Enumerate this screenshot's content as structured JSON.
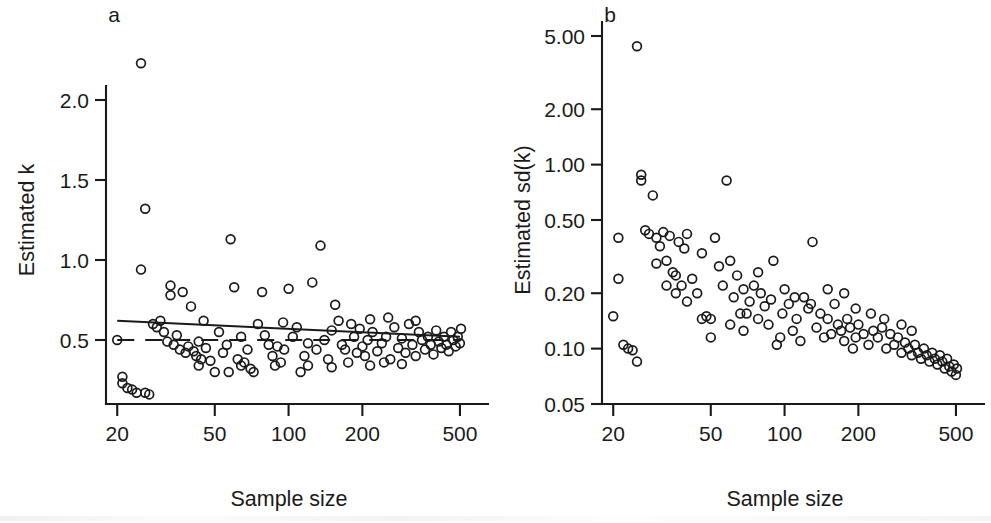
{
  "figure": {
    "background": "#ffffff",
    "ink_color": "#1a1a1a",
    "panel_labels": {
      "a": "a",
      "b": "b"
    }
  },
  "chart_data": [
    {
      "type": "scatter",
      "panel": "a",
      "title": "",
      "xlabel": "Sample size",
      "ylabel": "Estimated k",
      "xscale": "log",
      "yscale": "linear",
      "xlim": [
        18,
        560
      ],
      "ylim": [
        0.1,
        2.4
      ],
      "xticks": [
        20,
        50,
        100,
        200,
        500
      ],
      "xticklabels": [
        "20",
        "50",
        "100",
        "200",
        "500"
      ],
      "yticks": [
        0.5,
        1.0,
        1.5,
        2.0
      ],
      "yticklabels": [
        "0.5",
        "1.0",
        "1.5",
        "2.0"
      ],
      "grid": false,
      "legend": "none",
      "marker": "open-circle",
      "annotations": [
        {
          "kind": "fit-line",
          "style": "solid",
          "label": "regression of estimated k on log sample size",
          "x": [
            20,
            500
          ],
          "y": [
            0.62,
            0.52
          ]
        },
        {
          "kind": "reference-line",
          "style": "dashed",
          "label": "true k = 0.5",
          "x": [
            20,
            500
          ],
          "y": [
            0.5,
            0.5
          ]
        }
      ],
      "points": [
        [
          20,
          0.5
        ],
        [
          21,
          0.27
        ],
        [
          21,
          0.23
        ],
        [
          22,
          0.2
        ],
        [
          23,
          0.19
        ],
        [
          24,
          0.17
        ],
        [
          25,
          2.23
        ],
        [
          25,
          0.94
        ],
        [
          26,
          1.32
        ],
        [
          26,
          0.17
        ],
        [
          27,
          0.16
        ],
        [
          28,
          0.6
        ],
        [
          29,
          0.58
        ],
        [
          30,
          0.62
        ],
        [
          31,
          0.55
        ],
        [
          32,
          0.49
        ],
        [
          33,
          0.84
        ],
        [
          33,
          0.78
        ],
        [
          34,
          0.47
        ],
        [
          35,
          0.53
        ],
        [
          36,
          0.44
        ],
        [
          37,
          0.8
        ],
        [
          38,
          0.42
        ],
        [
          39,
          0.46
        ],
        [
          40,
          0.71
        ],
        [
          41,
          0.43
        ],
        [
          42,
          0.4
        ],
        [
          43,
          0.49
        ],
        [
          44,
          0.38
        ],
        [
          46,
          0.45
        ],
        [
          48,
          0.37
        ],
        [
          50,
          0.3
        ],
        [
          52,
          0.55
        ],
        [
          54,
          0.42
        ],
        [
          56,
          0.47
        ],
        [
          58,
          1.13
        ],
        [
          60,
          0.83
        ],
        [
          62,
          0.38
        ],
        [
          64,
          0.52
        ],
        [
          66,
          0.36
        ],
        [
          68,
          0.44
        ],
        [
          70,
          0.32
        ],
        [
          72,
          0.3
        ],
        [
          75,
          0.6
        ],
        [
          78,
          0.8
        ],
        [
          80,
          0.53
        ],
        [
          83,
          0.47
        ],
        [
          86,
          0.4
        ],
        [
          90,
          0.46
        ],
        [
          93,
          0.36
        ],
        [
          96,
          0.44
        ],
        [
          100,
          0.82
        ],
        [
          104,
          0.52
        ],
        [
          108,
          0.58
        ],
        [
          112,
          0.3
        ],
        [
          116,
          0.4
        ],
        [
          120,
          0.48
        ],
        [
          125,
          0.86
        ],
        [
          130,
          0.44
        ],
        [
          135,
          1.09
        ],
        [
          140,
          0.5
        ],
        [
          145,
          0.38
        ],
        [
          150,
          0.56
        ],
        [
          155,
          0.72
        ],
        [
          160,
          0.62
        ],
        [
          165,
          0.47
        ],
        [
          170,
          0.44
        ],
        [
          175,
          0.36
        ],
        [
          180,
          0.6
        ],
        [
          185,
          0.52
        ],
        [
          190,
          0.42
        ],
        [
          195,
          0.57
        ],
        [
          200,
          0.46
        ],
        [
          205,
          0.4
        ],
        [
          210,
          0.5
        ],
        [
          215,
          0.34
        ],
        [
          220,
          0.55
        ],
        [
          230,
          0.43
        ],
        [
          240,
          0.48
        ],
        [
          250,
          0.52
        ],
        [
          255,
          0.64
        ],
        [
          260,
          0.38
        ],
        [
          270,
          0.58
        ],
        [
          280,
          0.45
        ],
        [
          290,
          0.51
        ],
        [
          300,
          0.42
        ],
        [
          310,
          0.6
        ],
        [
          320,
          0.47
        ],
        [
          330,
          0.4
        ],
        [
          340,
          0.55
        ],
        [
          350,
          0.5
        ],
        [
          360,
          0.44
        ],
        [
          370,
          0.52
        ],
        [
          380,
          0.47
        ],
        [
          390,
          0.41
        ],
        [
          400,
          0.56
        ],
        [
          410,
          0.49
        ],
        [
          420,
          0.45
        ],
        [
          430,
          0.52
        ],
        [
          440,
          0.47
        ],
        [
          450,
          0.43
        ],
        [
          460,
          0.55
        ],
        [
          470,
          0.5
        ],
        [
          480,
          0.46
        ],
        [
          490,
          0.52
        ],
        [
          500,
          0.48
        ],
        [
          505,
          0.57
        ],
        [
          330,
          0.62
        ],
        [
          290,
          0.35
        ],
        [
          245,
          0.36
        ],
        [
          215,
          0.63
        ],
        [
          150,
          0.33
        ],
        [
          120,
          0.34
        ],
        [
          95,
          0.61
        ],
        [
          88,
          0.34
        ],
        [
          64,
          0.34
        ],
        [
          57,
          0.3
        ],
        [
          45,
          0.62
        ],
        [
          43,
          0.34
        ]
      ]
    },
    {
      "type": "scatter",
      "panel": "b",
      "title": "",
      "xlabel": "Sample size",
      "ylabel": "Estimated sd(k)",
      "xscale": "log",
      "yscale": "log",
      "xlim": [
        18,
        560
      ],
      "ylim": [
        0.05,
        5.0
      ],
      "xticks": [
        20,
        50,
        100,
        200,
        500
      ],
      "xticklabels": [
        "20",
        "50",
        "100",
        "200",
        "500"
      ],
      "yticks": [
        0.05,
        0.1,
        0.2,
        0.5,
        1.0,
        2.0,
        5.0
      ],
      "yticklabels": [
        "0.05",
        "0.10",
        "0.20",
        "0.50",
        "1.00",
        "2.00",
        "5.00"
      ],
      "grid": false,
      "legend": "none",
      "marker": "open-circle",
      "annotations": [],
      "points": [
        [
          20,
          0.15
        ],
        [
          21,
          0.4
        ],
        [
          21,
          0.24
        ],
        [
          22,
          0.105
        ],
        [
          23,
          0.1
        ],
        [
          24,
          0.098
        ],
        [
          25,
          4.4
        ],
        [
          25,
          0.085
        ],
        [
          26,
          0.88
        ],
        [
          26,
          0.82
        ],
        [
          27,
          0.44
        ],
        [
          28,
          0.42
        ],
        [
          29,
          0.68
        ],
        [
          30,
          0.4
        ],
        [
          31,
          0.36
        ],
        [
          32,
          0.43
        ],
        [
          33,
          0.3
        ],
        [
          34,
          0.41
        ],
        [
          35,
          0.26
        ],
        [
          36,
          0.25
        ],
        [
          37,
          0.38
        ],
        [
          38,
          0.22
        ],
        [
          39,
          0.35
        ],
        [
          40,
          0.42
        ],
        [
          42,
          0.24
        ],
        [
          44,
          0.2
        ],
        [
          46,
          0.33
        ],
        [
          48,
          0.15
        ],
        [
          50,
          0.145
        ],
        [
          52,
          0.4
        ],
        [
          54,
          0.28
        ],
        [
          56,
          0.22
        ],
        [
          58,
          0.82
        ],
        [
          60,
          0.3
        ],
        [
          62,
          0.19
        ],
        [
          64,
          0.25
        ],
        [
          66,
          0.155
        ],
        [
          68,
          0.21
        ],
        [
          70,
          0.155
        ],
        [
          72,
          0.18
        ],
        [
          75,
          0.22
        ],
        [
          78,
          0.26
        ],
        [
          80,
          0.2
        ],
        [
          83,
          0.17
        ],
        [
          86,
          0.135
        ],
        [
          90,
          0.3
        ],
        [
          93,
          0.105
        ],
        [
          96,
          0.115
        ],
        [
          100,
          0.21
        ],
        [
          104,
          0.175
        ],
        [
          108,
          0.125
        ],
        [
          112,
          0.145
        ],
        [
          116,
          0.11
        ],
        [
          120,
          0.19
        ],
        [
          125,
          0.165
        ],
        [
          130,
          0.38
        ],
        [
          135,
          0.13
        ],
        [
          140,
          0.155
        ],
        [
          145,
          0.115
        ],
        [
          150,
          0.145
        ],
        [
          155,
          0.12
        ],
        [
          160,
          0.175
        ],
        [
          165,
          0.135
        ],
        [
          170,
          0.125
        ],
        [
          175,
          0.11
        ],
        [
          180,
          0.145
        ],
        [
          185,
          0.13
        ],
        [
          190,
          0.1
        ],
        [
          195,
          0.115
        ],
        [
          200,
          0.135
        ],
        [
          210,
          0.12
        ],
        [
          220,
          0.105
        ],
        [
          230,
          0.125
        ],
        [
          240,
          0.115
        ],
        [
          250,
          0.13
        ],
        [
          260,
          0.1
        ],
        [
          270,
          0.12
        ],
        [
          280,
          0.105
        ],
        [
          290,
          0.115
        ],
        [
          300,
          0.095
        ],
        [
          310,
          0.108
        ],
        [
          320,
          0.1
        ],
        [
          330,
          0.092
        ],
        [
          340,
          0.105
        ],
        [
          350,
          0.095
        ],
        [
          360,
          0.088
        ],
        [
          370,
          0.1
        ],
        [
          380,
          0.092
        ],
        [
          390,
          0.085
        ],
        [
          400,
          0.095
        ],
        [
          410,
          0.088
        ],
        [
          420,
          0.082
        ],
        [
          430,
          0.092
        ],
        [
          440,
          0.085
        ],
        [
          450,
          0.078
        ],
        [
          460,
          0.088
        ],
        [
          470,
          0.08
        ],
        [
          480,
          0.075
        ],
        [
          490,
          0.082
        ],
        [
          500,
          0.072
        ],
        [
          505,
          0.078
        ],
        [
          330,
          0.125
        ],
        [
          300,
          0.135
        ],
        [
          255,
          0.145
        ],
        [
          225,
          0.155
        ],
        [
          195,
          0.165
        ],
        [
          175,
          0.2
        ],
        [
          150,
          0.21
        ],
        [
          128,
          0.175
        ],
        [
          110,
          0.19
        ],
        [
          98,
          0.155
        ],
        [
          88,
          0.185
        ],
        [
          78,
          0.145
        ],
        [
          68,
          0.125
        ],
        [
          60,
          0.135
        ],
        [
          50,
          0.115
        ],
        [
          46,
          0.145
        ],
        [
          40,
          0.18
        ],
        [
          36,
          0.2
        ],
        [
          33,
          0.22
        ],
        [
          30,
          0.29
        ]
      ]
    }
  ]
}
